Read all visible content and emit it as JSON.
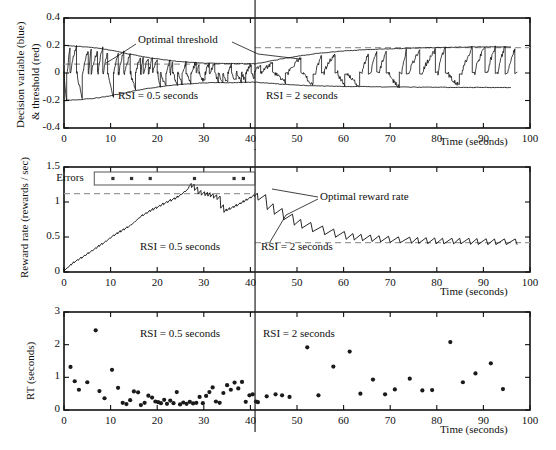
{
  "figure": {
    "background": "#ffffff",
    "ink": "#111111",
    "dash_color": "#9a9a9a",
    "divider_color": "#222222",
    "divider_time": 41
  },
  "panels": [
    {
      "id": "decision-variable",
      "ylabel_line1": "Decision variable (blue)",
      "ylabel_line2": "& threshold (red)",
      "xlabel": "Time (seconds)",
      "xticks": [
        0,
        10,
        20,
        30,
        40,
        50,
        60,
        70,
        80,
        90,
        100
      ],
      "yticks": [
        -0.4,
        -0.2,
        0,
        0.2,
        0.4
      ],
      "ytick_labels": [
        "-0.4",
        "-0.2",
        "0",
        "0.2",
        "0.4"
      ],
      "xlim": [
        0,
        100
      ],
      "ylim": [
        -0.4,
        0.4
      ],
      "annotations": [
        {
          "name": "optimal-threshold",
          "text": "Optimal threshold",
          "x": 13,
          "y": 0.3
        },
        {
          "name": "rsi-left",
          "text": "RSI = 0.5 seconds",
          "x": 12,
          "y": -0.26
        },
        {
          "name": "rsi-right",
          "text": "RSI = 2 seconds",
          "x": 44,
          "y": -0.26
        }
      ],
      "reference_lines": [
        {
          "name": "optimal-threshold-left",
          "y": 0.065,
          "x_from": 0,
          "x_to": 41
        },
        {
          "name": "optimal-threshold-right",
          "y": 0.185,
          "x_from": 41,
          "x_to": 100
        }
      ]
    },
    {
      "id": "reward-rate",
      "ylabel_line1": "Reward rate (rewards / sec)",
      "xlabel": "Time (seconds)",
      "xticks": [
        0,
        10,
        20,
        30,
        40,
        50,
        60,
        70,
        80,
        90,
        100
      ],
      "yticks": [
        0,
        0.5,
        1,
        1.5
      ],
      "ytick_labels": [
        "0",
        "0.5",
        "1",
        "1.5"
      ],
      "xlim": [
        0,
        100
      ],
      "ylim": [
        0,
        1.5
      ],
      "errors_label": "Errors",
      "error_marks": [
        10.5,
        14.5,
        18.5,
        28.0,
        36.5,
        38.5
      ],
      "annotations": [
        {
          "name": "optimal-reward-rate",
          "text": "Optimal reward rate",
          "x": 57,
          "y": 1.03
        },
        {
          "name": "rsi-left",
          "text": "RSI = 0.5 seconds",
          "x": 18,
          "y": 0.29
        },
        {
          "name": "rsi-right",
          "text": "RSI = 2 seconds",
          "x": 43,
          "y": 0.29
        }
      ],
      "reference_lines": [
        {
          "name": "optimal-reward-rate-left",
          "y": 1.12,
          "x_from": 0,
          "x_to": 41
        },
        {
          "name": "optimal-reward-rate-right",
          "y": 0.42,
          "x_from": 41,
          "x_to": 100
        }
      ]
    },
    {
      "id": "reaction-time",
      "ylabel_line1": "RT (seconds)",
      "xlabel": "Time (seconds)",
      "xticks": [
        0,
        10,
        20,
        30,
        40,
        50,
        60,
        70,
        80,
        90,
        100
      ],
      "yticks": [
        0,
        1,
        2,
        3
      ],
      "ytick_labels": [
        "0",
        "1",
        "2",
        "3"
      ],
      "xlim": [
        0,
        100
      ],
      "ylim": [
        0,
        3
      ],
      "annotations": [
        {
          "name": "rsi-left",
          "text": "RSI = 0.5 seconds",
          "x": 18,
          "y": 2.62
        },
        {
          "name": "rsi-right",
          "text": "RSI = 2 seconds",
          "x": 43,
          "y": 2.62
        }
      ]
    }
  ],
  "chart_data": [
    {
      "type": "line",
      "id": "decision-variable-panel",
      "title": "",
      "xlabel": "Time (seconds)",
      "ylabel": "Decision variable (blue) & threshold (red)",
      "xlim": [
        0,
        100
      ],
      "ylim": [
        -0.4,
        0.4
      ],
      "xticks": [
        0,
        10,
        20,
        30,
        40,
        50,
        60,
        70,
        80,
        90,
        100
      ],
      "yticks": [
        -0.4,
        -0.2,
        0,
        0.2,
        0.4
      ],
      "grid": false,
      "legend": "none",
      "annotations": [
        "Optimal threshold",
        "RSI = 0.5 seconds",
        "RSI = 2 seconds"
      ],
      "series": [
        {
          "name": "upper threshold (red)",
          "description": "Adapting positive decision threshold; starts ~0.20, decays to ~0.065 by t=41, then rises to ~0.19 by t=100",
          "x": [
            0,
            3,
            6,
            9,
            12,
            15,
            18,
            21,
            24,
            27,
            30,
            33,
            36,
            39,
            41,
            44,
            47,
            50,
            55,
            60,
            65,
            70,
            75,
            80,
            85,
            90,
            95,
            100
          ],
          "values": [
            0.2,
            0.194,
            0.186,
            0.172,
            0.152,
            0.131,
            0.112,
            0.098,
            0.086,
            0.078,
            0.072,
            0.07,
            0.07,
            0.068,
            0.067,
            0.085,
            0.105,
            0.122,
            0.145,
            0.16,
            0.17,
            0.176,
            0.181,
            0.185,
            0.188,
            0.19,
            0.191,
            0.192
          ]
        },
        {
          "name": "lower threshold (red)",
          "description": "Mirror of upper threshold (negative)",
          "x": [
            0,
            3,
            6,
            9,
            12,
            15,
            18,
            21,
            24,
            27,
            30,
            33,
            36,
            39,
            41,
            44,
            47,
            50,
            55,
            60,
            65,
            70,
            75,
            80,
            85,
            90,
            95,
            100
          ],
          "values": [
            -0.2,
            -0.194,
            -0.186,
            -0.172,
            -0.152,
            -0.131,
            -0.112,
            -0.098,
            -0.086,
            -0.078,
            -0.072,
            -0.07,
            -0.07,
            -0.068,
            -0.067,
            -0.075,
            -0.082,
            -0.088,
            -0.094,
            -0.098,
            -0.1,
            -0.102,
            -0.103,
            -0.104,
            -0.105,
            -0.105,
            -0.106,
            -0.106
          ]
        },
        {
          "name": "decision variable (blue)",
          "description": "Noisy accumulator oscillating between thresholds; high-frequency sawtooth excursions, denser/faster during RSI = 0.5 s, slower with wider spikes during RSI = 2 s",
          "range": [
            -0.21,
            0.2
          ]
        }
      ],
      "reference_lines": [
        {
          "name": "optimal threshold (RSI = 0.5 s)",
          "y": 0.065,
          "style": "dashed",
          "x_range": [
            0,
            41
          ]
        },
        {
          "name": "optimal threshold (RSI = 2 s)",
          "y": 0.185,
          "style": "dashed",
          "x_range": [
            41,
            100
          ]
        }
      ],
      "vlines": [
        {
          "x": 41,
          "style": "solid",
          "label": "RSI switch"
        }
      ]
    },
    {
      "type": "line",
      "id": "reward-rate-panel",
      "title": "",
      "xlabel": "Time (seconds)",
      "ylabel": "Reward rate (rewards / sec)",
      "xlim": [
        0,
        100
      ],
      "ylim": [
        0,
        1.5
      ],
      "xticks": [
        0,
        10,
        20,
        30,
        40,
        50,
        60,
        70,
        80,
        90,
        100
      ],
      "yticks": [
        0,
        0.5,
        1,
        1.5
      ],
      "grid": false,
      "legend": "none",
      "annotations": [
        "Errors",
        "Optimal reward rate",
        "RSI = 0.5 seconds",
        "RSI = 2 seconds"
      ],
      "series": [
        {
          "name": "running reward rate",
          "description": "Sawtooth running estimate of reward rate: rises from 0 to ~1.25 peak near t=27, dips to ~0.85 near t=34, recovers to ~1.10 at t=41, then decays to ~0.42 asymptote",
          "x": [
            0,
            2,
            4,
            6,
            8,
            10,
            12,
            14,
            16,
            18,
            20,
            22,
            24,
            26,
            27,
            29,
            31,
            33,
            34,
            36,
            38,
            40,
            41,
            43,
            45,
            47,
            50,
            53,
            56,
            60,
            65,
            70,
            75,
            80,
            85,
            90,
            95
          ],
          "values": [
            0.03,
            0.14,
            0.22,
            0.31,
            0.4,
            0.5,
            0.58,
            0.66,
            0.78,
            0.86,
            0.93,
            1.0,
            1.06,
            1.16,
            1.25,
            1.12,
            1.1,
            1.05,
            0.86,
            0.92,
            0.99,
            1.07,
            1.1,
            0.95,
            0.86,
            0.78,
            0.68,
            0.61,
            0.56,
            0.5,
            0.47,
            0.45,
            0.44,
            0.43,
            0.43,
            0.42,
            0.42
          ]
        }
      ],
      "error_trial_times": [
        10.5,
        14.5,
        18.5,
        28.0,
        36.5,
        38.5
      ],
      "reference_lines": [
        {
          "name": "optimal reward rate (RSI = 0.5 s)",
          "y": 1.12,
          "style": "dashed",
          "x_range": [
            0,
            41
          ]
        },
        {
          "name": "optimal reward rate (RSI = 2 s)",
          "y": 0.42,
          "style": "dashed",
          "x_range": [
            41,
            100
          ]
        }
      ],
      "vlines": [
        {
          "x": 41,
          "style": "solid",
          "label": "RSI switch"
        }
      ]
    },
    {
      "type": "scatter",
      "id": "reaction-time-panel",
      "title": "",
      "xlabel": "Time (seconds)",
      "ylabel": "RT (seconds)",
      "xlim": [
        0,
        100
      ],
      "ylim": [
        0,
        3
      ],
      "xticks": [
        0,
        10,
        20,
        30,
        40,
        50,
        60,
        70,
        80,
        90,
        100
      ],
      "yticks": [
        0,
        1,
        2,
        3
      ],
      "grid": false,
      "legend": "none",
      "annotations": [
        "RSI = 0.5 seconds",
        "RSI = 2 seconds"
      ],
      "points": [
        [
          1.4,
          1.32
        ],
        [
          2.3,
          0.88
        ],
        [
          3.2,
          0.62
        ],
        [
          5.0,
          0.85
        ],
        [
          6.8,
          2.44
        ],
        [
          7.6,
          0.58
        ],
        [
          8.7,
          0.36
        ],
        [
          10.3,
          1.23
        ],
        [
          11.6,
          0.68
        ],
        [
          12.6,
          0.22
        ],
        [
          13.4,
          0.18
        ],
        [
          14.2,
          0.3
        ],
        [
          15.0,
          0.57
        ],
        [
          15.9,
          0.54
        ],
        [
          16.5,
          0.15
        ],
        [
          17.3,
          0.22
        ],
        [
          18.1,
          0.44
        ],
        [
          18.9,
          0.38
        ],
        [
          19.6,
          0.26
        ],
        [
          20.2,
          0.24
        ],
        [
          20.8,
          0.21
        ],
        [
          21.5,
          0.31
        ],
        [
          22.1,
          0.19
        ],
        [
          22.8,
          0.29
        ],
        [
          23.5,
          0.21
        ],
        [
          24.2,
          0.55
        ],
        [
          24.9,
          0.17
        ],
        [
          25.6,
          0.23
        ],
        [
          26.3,
          0.19
        ],
        [
          27.0,
          0.25
        ],
        [
          27.7,
          0.2
        ],
        [
          28.4,
          0.22
        ],
        [
          29.1,
          0.4
        ],
        [
          29.8,
          0.21
        ],
        [
          30.5,
          0.43
        ],
        [
          31.2,
          0.55
        ],
        [
          31.9,
          0.69
        ],
        [
          32.6,
          0.26
        ],
        [
          33.4,
          0.22
        ],
        [
          34.2,
          0.52
        ],
        [
          35.0,
          0.76
        ],
        [
          35.8,
          0.62
        ],
        [
          36.6,
          0.84
        ],
        [
          37.4,
          0.66
        ],
        [
          38.2,
          0.86
        ],
        [
          39.0,
          0.25
        ],
        [
          39.8,
          0.45
        ],
        [
          40.5,
          0.48
        ],
        [
          41.2,
          0.26
        ],
        [
          41.6,
          0.24
        ],
        [
          43.5,
          0.42
        ],
        [
          45.4,
          0.48
        ],
        [
          46.8,
          0.45
        ],
        [
          48.4,
          0.4
        ],
        [
          52.2,
          1.92
        ],
        [
          54.6,
          0.45
        ],
        [
          57.8,
          1.33
        ],
        [
          61.3,
          1.79
        ],
        [
          63.6,
          0.5
        ],
        [
          66.3,
          0.93
        ],
        [
          68.9,
          0.48
        ],
        [
          71.0,
          0.63
        ],
        [
          74.2,
          0.96
        ],
        [
          76.9,
          0.6
        ],
        [
          79.0,
          0.61
        ],
        [
          82.9,
          2.08
        ],
        [
          85.6,
          0.85
        ],
        [
          88.3,
          1.12
        ],
        [
          91.6,
          1.43
        ],
        [
          94.2,
          0.64
        ]
      ],
      "marker": "filled-circle",
      "vlines": [
        {
          "x": 41,
          "style": "solid",
          "label": "RSI switch"
        }
      ]
    }
  ]
}
